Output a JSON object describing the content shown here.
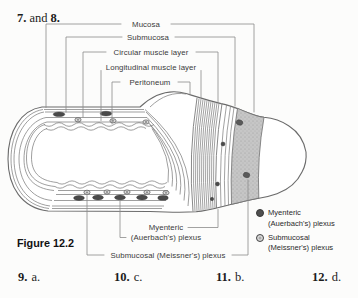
{
  "page": {
    "question_header": {
      "first": "7.",
      "middle": "and",
      "second": "8."
    },
    "figure_label": "Figure 12.2",
    "answers": [
      {
        "number": "9.",
        "letter": "a."
      },
      {
        "number": "10.",
        "letter": "c."
      },
      {
        "number": "11.",
        "letter": "b."
      },
      {
        "number": "12.",
        "letter": "d."
      }
    ]
  },
  "diagram": {
    "layer_labels": {
      "mucosa": "Mucosa",
      "submucosa": "Submucosa",
      "circular_muscle": "Circular muscle layer",
      "longitudinal_muscle": "Longitudinal muscle layer",
      "peritoneum": "Peritoneum"
    },
    "plexus_labels": {
      "myenteric_line1": "Myenteric",
      "myenteric_line2": "(Auerbach's) plexus",
      "submucosal": "Submucosal (Meissner's) plexus"
    },
    "legend": {
      "items": [
        {
          "symbol": "filled-circle",
          "color": "#4f4f4f",
          "line1": "Myenteric",
          "line2": "(Auerbach's) plexus"
        },
        {
          "symbol": "ringed-circle",
          "color": "#ababab",
          "line1": "Submucosal",
          "line2": "(Meissner's) plexus"
        }
      ]
    },
    "colors": {
      "outline": "#6b6b6b",
      "leader_line": "#8a8a8a",
      "submucosa_band": "#c6c6c6",
      "plexus_dot": "#4a4a4a",
      "paper": "#fcfcfb"
    }
  }
}
